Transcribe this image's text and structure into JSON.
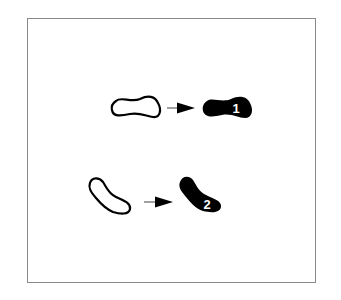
{
  "figure": {
    "type": "footprint-step-diagram",
    "frame_color": "#8a8a8a",
    "ink_color": "#000000",
    "steps": [
      {
        "from": {
          "shape": "footprint-outline",
          "orientation": "horizontal"
        },
        "arrow": "right-arrow",
        "to": {
          "shape": "footprint-filled",
          "orientation": "horizontal"
        },
        "label": "1"
      },
      {
        "from": {
          "shape": "footprint-outline",
          "orientation": "diagonal"
        },
        "arrow": "right-arrow",
        "to": {
          "shape": "footprint-filled",
          "orientation": "diagonal"
        },
        "label": "2"
      }
    ]
  },
  "caption": ""
}
